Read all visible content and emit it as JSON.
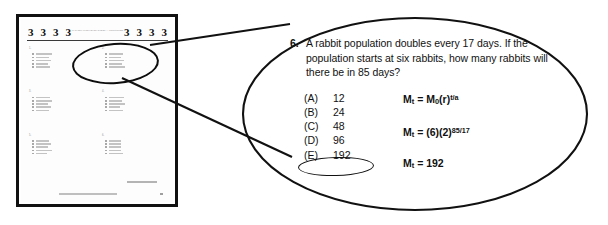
{
  "exam_page": {
    "section_markers_left": [
      "3",
      "3",
      "3",
      "3"
    ],
    "section_markers_right": [
      "3",
      "3",
      "3",
      "3"
    ],
    "header_title": "MATHEMATICS LEVEL 2 TEST — CONTINUED",
    "columns": [
      {
        "questions": [
          {},
          {},
          {}
        ]
      },
      {
        "questions": [
          {},
          {},
          {}
        ]
      }
    ]
  },
  "callout": {
    "question_number": "6.",
    "question_text": "A rabbit population doubles every 17 days.  If the population starts at six rabbits, how many rabbits will there be in 85 days?",
    "choices": [
      {
        "letter": "(A)",
        "value": "12",
        "circled": false
      },
      {
        "letter": "(B)",
        "value": "24",
        "circled": false
      },
      {
        "letter": "(C)",
        "value": "48",
        "circled": false
      },
      {
        "letter": "(D)",
        "value": "96",
        "circled": false
      },
      {
        "letter": "(E)",
        "value": "192",
        "circled": true
      }
    ],
    "formulas": [
      {
        "lhs": "M",
        "lhs_sub": "t",
        "eq": " = M",
        "base_sub": "0",
        "base": "(r)",
        "exponent": "t/a"
      },
      {
        "lhs": "M",
        "lhs_sub": "t",
        "eq": " = (6)(2)",
        "base_sub": "",
        "base": "",
        "exponent": "85/17"
      },
      {
        "lhs": "M",
        "lhs_sub": "t",
        "eq": " = 192",
        "base_sub": "",
        "base": "",
        "exponent": ""
      }
    ]
  },
  "colors": {
    "ink": "#111111",
    "page_border": "#111111",
    "blurred_text": "#bdbdbd",
    "background": "#ffffff"
  }
}
